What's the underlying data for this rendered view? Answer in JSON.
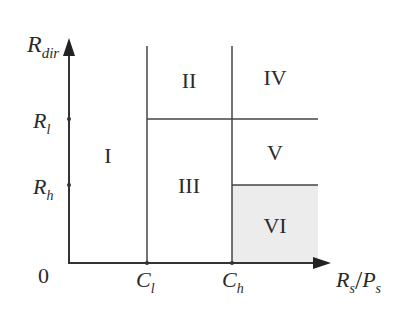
{
  "axes": {
    "y_label_main": "R",
    "y_label_sub": "dir",
    "x_label_a_main": "R",
    "x_label_a_sub": "s",
    "x_label_sep": "/",
    "x_label_b_main": "P",
    "x_label_b_sub": "s",
    "origin": "0"
  },
  "y_ticks": [
    {
      "main": "R",
      "sub": "l"
    },
    {
      "main": "R",
      "sub": "h"
    }
  ],
  "x_ticks": [
    {
      "main": "C",
      "sub": "l"
    },
    {
      "main": "C",
      "sub": "h"
    }
  ],
  "regions": [
    {
      "id": "I",
      "label": "I"
    },
    {
      "id": "II",
      "label": "II"
    },
    {
      "id": "III",
      "label": "III"
    },
    {
      "id": "IV",
      "label": "IV"
    },
    {
      "id": "V",
      "label": "V"
    },
    {
      "id": "VI",
      "label": "VI",
      "shaded": true
    }
  ],
  "colors": {
    "line": "#333333",
    "shade": "#ececec",
    "text": "#2a2a2a"
  }
}
